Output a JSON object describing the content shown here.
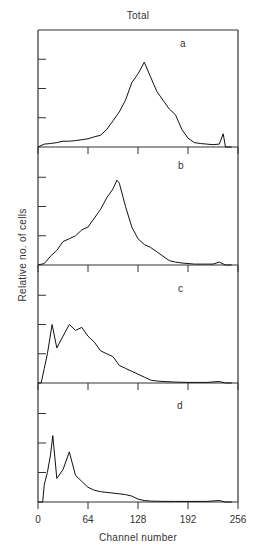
{
  "figure": {
    "title": "Total",
    "ylabel": "Relative no. of cells",
    "xlabel": "Channel number",
    "xticks": [
      "0",
      "64",
      "128",
      "192",
      "256"
    ]
  },
  "chart_data": {
    "type": "line",
    "title": "Total",
    "xlabel": "Channel number",
    "ylabel": "Relative no. of cells",
    "xlim": [
      0,
      256
    ],
    "xticks": [
      0,
      64,
      128,
      192,
      256
    ],
    "ylim": [
      0,
      4
    ],
    "y_units": "relative (tick divisions, unlabeled)",
    "grid": false,
    "legend": null,
    "layout": "4 vertically stacked panels sharing x-axis",
    "panels": [
      {
        "label": "a",
        "x": [
          0,
          8,
          16,
          24,
          32,
          40,
          48,
          56,
          64,
          72,
          80,
          88,
          96,
          104,
          112,
          120,
          128,
          136,
          144,
          152,
          160,
          168,
          176,
          184,
          192,
          200,
          208,
          216,
          224,
          232,
          237,
          240,
          248
        ],
        "y": [
          0.0,
          0.1,
          0.12,
          0.15,
          0.2,
          0.2,
          0.22,
          0.25,
          0.28,
          0.35,
          0.4,
          0.6,
          0.9,
          1.2,
          1.6,
          2.2,
          2.5,
          2.9,
          2.4,
          1.9,
          1.6,
          1.3,
          1.1,
          0.6,
          0.3,
          0.15,
          0.12,
          0.1,
          0.08,
          0.1,
          0.45,
          0.0,
          0.0
        ]
      },
      {
        "label": "b",
        "x": [
          0,
          8,
          16,
          24,
          32,
          40,
          48,
          56,
          64,
          72,
          80,
          88,
          96,
          101,
          104,
          112,
          120,
          128,
          136,
          144,
          152,
          160,
          168,
          176,
          184,
          192,
          200,
          208,
          216,
          224,
          232,
          240,
          248
        ],
        "y": [
          0.0,
          0.05,
          0.3,
          0.5,
          0.8,
          0.9,
          1.0,
          1.2,
          1.3,
          1.6,
          1.9,
          2.3,
          2.6,
          2.9,
          2.8,
          2.0,
          1.3,
          0.9,
          0.7,
          0.6,
          0.45,
          0.3,
          0.15,
          0.1,
          0.07,
          0.05,
          0.03,
          0.03,
          0.03,
          0.03,
          0.1,
          0.0,
          0.0
        ]
      },
      {
        "label": "c",
        "x": [
          0,
          4,
          8,
          12,
          18,
          24,
          32,
          40,
          48,
          56,
          64,
          72,
          80,
          88,
          96,
          104,
          112,
          120,
          128,
          136,
          144,
          152,
          160,
          176,
          192,
          200,
          216,
          232,
          240,
          248
        ],
        "y": [
          0.0,
          0.0,
          0.5,
          1.0,
          2.0,
          1.2,
          1.6,
          2.0,
          1.8,
          1.9,
          1.6,
          1.4,
          1.1,
          1.0,
          0.9,
          0.6,
          0.5,
          0.4,
          0.3,
          0.2,
          0.1,
          0.07,
          0.05,
          0.03,
          0.02,
          0.02,
          0.02,
          0.05,
          0.0,
          0.0
        ]
      },
      {
        "label": "d",
        "x": [
          0,
          6,
          8,
          12,
          16,
          19,
          24,
          32,
          40,
          48,
          56,
          64,
          72,
          80,
          96,
          112,
          120,
          128,
          136,
          144,
          160,
          176,
          192,
          216,
          232,
          240,
          248
        ],
        "y": [
          0.0,
          0.0,
          0.6,
          1.0,
          1.6,
          2.25,
          0.8,
          1.1,
          1.7,
          0.9,
          0.7,
          0.5,
          0.4,
          0.35,
          0.3,
          0.25,
          0.2,
          0.1,
          0.05,
          0.03,
          0.02,
          0.02,
          0.02,
          0.02,
          0.05,
          0.0,
          0.0
        ]
      }
    ]
  }
}
